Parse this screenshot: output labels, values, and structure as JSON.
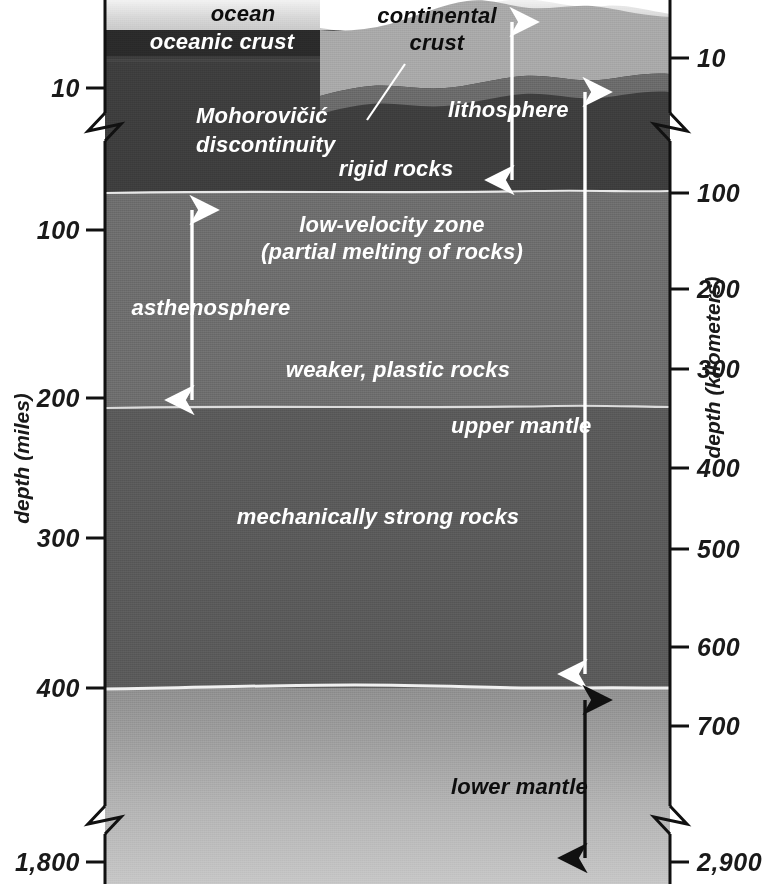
{
  "figure": {
    "kind": "earth-interior-cross-section",
    "left_axis": {
      "title": "depth (miles)",
      "unit": "miles",
      "ticks": [
        {
          "label": "10",
          "y": 88
        },
        {
          "label": "100",
          "y": 230
        },
        {
          "label": "200",
          "y": 398
        },
        {
          "label": "300",
          "y": 538
        },
        {
          "label": "400",
          "y": 688
        },
        {
          "label": "1,800",
          "y": 862
        }
      ],
      "break_y": 126
    },
    "right_axis": {
      "title": "depth (kilometers)",
      "unit": "kilometers",
      "ticks": [
        {
          "label": "10",
          "y": 58
        },
        {
          "label": "100",
          "y": 193
        },
        {
          "label": "200",
          "y": 289
        },
        {
          "label": "300",
          "y": 369
        },
        {
          "label": "400",
          "y": 468
        },
        {
          "label": "500",
          "y": 549
        },
        {
          "label": "600",
          "y": 647
        },
        {
          "label": "700",
          "y": 726
        },
        {
          "label": "2,900",
          "y": 862
        }
      ],
      "break_y": 126
    },
    "labels": {
      "ocean": "ocean",
      "oceanic_crust": "oceanic crust",
      "continental_crust_line1": "continental",
      "continental_crust_line2": "crust",
      "moho_line1": "Mohorovičić",
      "moho_line2": "discontinuity",
      "rigid_rocks": "rigid rocks",
      "lithosphere": "lithosphere",
      "low_velocity_line1": "low-velocity zone",
      "low_velocity_line2": "(partial melting of rocks)",
      "asthenosphere": "asthenosphere",
      "weaker_plastic": "weaker, plastic rocks",
      "mechanically_strong": "mechanically strong rocks",
      "upper_mantle": "upper mantle",
      "lower_mantle": "lower mantle"
    },
    "arrows": [
      {
        "name": "lithosphere-arrow",
        "color": "#ffffff",
        "x": 512,
        "y1": 12,
        "y2": 188,
        "heads": "both"
      },
      {
        "name": "asthenosphere-arrow",
        "color": "#ffffff",
        "x": 192,
        "y1": 200,
        "y2": 408,
        "heads": "both"
      },
      {
        "name": "upper-mantle-arrow",
        "color": "#ffffff",
        "x": 585,
        "y1": 82,
        "y2": 682,
        "heads": "both"
      },
      {
        "name": "lower-mantle-arrow",
        "color": "#111111",
        "x": 585,
        "y1": 690,
        "y2": 866,
        "heads": "both"
      }
    ],
    "colors": {
      "ocean_top": "#f2f2f2",
      "ocean_bottom": "#c9c9c9",
      "oceanic_crust": "#2a2a2a",
      "continental_crust": "#a8a8a8",
      "lithospheric_mantle": "#3d3d3d",
      "moho_band": "#6a6a6a",
      "asthenosphere": "#6d6d6d",
      "mechanically_strong": "#5a5a5a",
      "lower_mantle_top": "#8e8e8e",
      "lower_mantle_bottom": "#c6c6c6",
      "boundary_line": "#e8e8e8",
      "axis": "#111111",
      "text_white": "#ffffff",
      "text_black": "#0d0d0d"
    }
  }
}
